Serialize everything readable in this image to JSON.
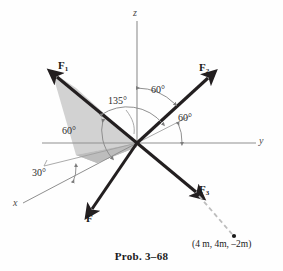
{
  "figure": {
    "caption": "Prob. 3–68",
    "axes": [
      {
        "name": "z-axis",
        "label": "z"
      },
      {
        "name": "y-axis",
        "label": "y"
      },
      {
        "name": "x-axis",
        "label": "x"
      }
    ],
    "vectors": [
      {
        "name": "F1",
        "label": "F",
        "subscript": "1"
      },
      {
        "name": "F2",
        "label": "F",
        "subscript": "2"
      },
      {
        "name": "F3",
        "label": "F",
        "subscript": "3"
      },
      {
        "name": "F",
        "label": "F",
        "subscript": ""
      }
    ],
    "angles": [
      {
        "name": "angle-z-f2",
        "label": "60°"
      },
      {
        "name": "angle-ref-y",
        "label": "60°"
      },
      {
        "name": "angle-135-f1",
        "label": "135°"
      },
      {
        "name": "angle-60-triangle",
        "label": "60°"
      },
      {
        "name": "angle-30-x",
        "label": "30°"
      }
    ],
    "point": {
      "label": "(4 m, 4m, –2m)"
    },
    "colors": {
      "vector": "#231f20",
      "axis": "#8a8a8a",
      "shade": "#d2d2d2",
      "shade_dark": "#b9b9b9",
      "dashed": "#bdbdbd",
      "text": "#1a1a1a"
    }
  }
}
